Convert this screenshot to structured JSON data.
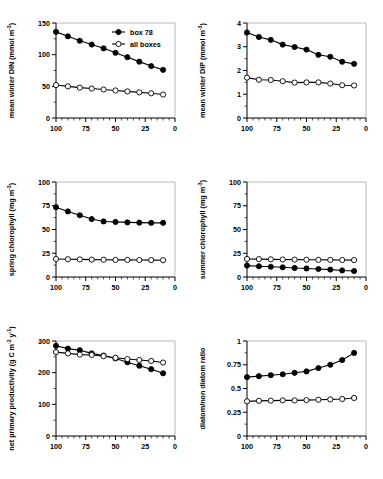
{
  "figure": {
    "panel_count": 6,
    "layout": "2 columns x 3 rows",
    "x_axis_shared": {
      "ticks": [
        "100",
        "75",
        "50",
        "25",
        "0"
      ],
      "range": [
        100,
        0
      ],
      "reversed": true
    },
    "legend": {
      "filled_label": "box 78",
      "open_label": "all boxes"
    },
    "colors": {
      "ink": "#000000",
      "frame": "#b9b9b9",
      "background": "#ffffff",
      "marker_open_fill": "#ffffff"
    }
  },
  "chart_data": [
    {
      "type": "line",
      "panel": "top-left",
      "title": "",
      "xlabel": "",
      "ylabel": "mean winter DIN (mmol m",
      "ylabel_sup": "-3",
      "ylabel_suffix": ")",
      "x": [
        100,
        90,
        80,
        70,
        60,
        50,
        40,
        30,
        20,
        10
      ],
      "xlim": [
        100,
        0
      ],
      "ylim": [
        0,
        150
      ],
      "yticks": [
        0,
        50,
        100,
        150
      ],
      "ytick_labels": [
        "0",
        "50",
        "100",
        "150"
      ],
      "grid": false,
      "legend_position": "top-right",
      "series": [
        {
          "name": "box 78",
          "marker": "filled",
          "values": [
            136,
            129,
            122,
            116,
            110,
            103,
            96,
            89,
            82,
            76
          ]
        },
        {
          "name": "all boxes",
          "marker": "open",
          "values": [
            52,
            50,
            48,
            46.5,
            45,
            43.5,
            42,
            40.5,
            39,
            37
          ]
        }
      ]
    },
    {
      "type": "line",
      "panel": "top-right",
      "title": "",
      "xlabel": "",
      "ylabel": "mean winter DIP (mmol m",
      "ylabel_sup": "-3",
      "ylabel_suffix": ")",
      "x": [
        100,
        90,
        80,
        70,
        60,
        50,
        40,
        30,
        20,
        10
      ],
      "xlim": [
        100,
        0
      ],
      "ylim": [
        0,
        4
      ],
      "yticks": [
        0,
        1,
        2,
        3,
        4
      ],
      "ytick_labels": [
        "0",
        "1",
        "2",
        "3",
        "4"
      ],
      "grid": false,
      "legend_position": "none",
      "series": [
        {
          "name": "box 78",
          "marker": "filled",
          "values": [
            3.6,
            3.41,
            3.29,
            3.09,
            2.99,
            2.88,
            2.66,
            2.58,
            2.37,
            2.28
          ]
        },
        {
          "name": "all boxes",
          "marker": "open",
          "values": [
            1.7,
            1.61,
            1.6,
            1.55,
            1.49,
            1.5,
            1.5,
            1.45,
            1.38,
            1.37
          ]
        }
      ]
    },
    {
      "type": "line",
      "panel": "middle-left",
      "title": "",
      "xlabel": "",
      "ylabel": "spring chlorophyll (mg m",
      "ylabel_sup": "-3",
      "ylabel_suffix": ")",
      "x": [
        100,
        90,
        80,
        70,
        60,
        50,
        40,
        30,
        20,
        10
      ],
      "xlim": [
        100,
        0
      ],
      "ylim": [
        0,
        100
      ],
      "yticks": [
        0,
        25,
        50,
        75,
        100
      ],
      "ytick_labels": [
        "0",
        "25",
        "50",
        "75",
        "100"
      ],
      "grid": false,
      "legend_position": "none",
      "series": [
        {
          "name": "box 78",
          "marker": "filled",
          "values": [
            73.5,
            69,
            65,
            61,
            58.5,
            58,
            57.5,
            57.2,
            57,
            57
          ]
        },
        {
          "name": "all boxes",
          "marker": "open",
          "values": [
            19,
            18.7,
            18.5,
            18.3,
            18.2,
            18,
            18,
            17.9,
            17.8,
            17.7
          ]
        }
      ]
    },
    {
      "type": "line",
      "panel": "middle-right",
      "title": "",
      "xlabel": "",
      "ylabel": "summer chlorophyll (mg m",
      "ylabel_sup": "-3",
      "ylabel_suffix": ")",
      "x": [
        100,
        90,
        80,
        70,
        60,
        50,
        40,
        30,
        20,
        10
      ],
      "xlim": [
        100,
        0
      ],
      "ylim": [
        0,
        100
      ],
      "yticks": [
        0,
        25,
        50,
        75,
        100
      ],
      "ytick_labels": [
        "0",
        "25",
        "50",
        "75",
        "100"
      ],
      "grid": false,
      "legend_position": "none",
      "series": [
        {
          "name": "box 78",
          "marker": "filled",
          "values": [
            12,
            11.3,
            10.8,
            10.2,
            9.5,
            9,
            8.4,
            7.8,
            6.9,
            6.3
          ]
        },
        {
          "name": "all boxes",
          "marker": "open",
          "values": [
            19,
            18.8,
            18.6,
            18.4,
            18.3,
            18.2,
            18.1,
            18,
            17.9,
            17.8
          ]
        }
      ]
    },
    {
      "type": "line",
      "panel": "bottom-left",
      "title": "",
      "xlabel": "",
      "ylabel": "net primary productivity (g C m",
      "ylabel_sup": "-2",
      "ylabel_sup2": "-1",
      "ylabel_mid": " y",
      "ylabel_suffix": ")",
      "x": [
        100,
        90,
        80,
        70,
        60,
        50,
        40,
        30,
        20,
        10
      ],
      "xlim": [
        100,
        0
      ],
      "ylim": [
        0,
        300
      ],
      "yticks": [
        0,
        100,
        200,
        300
      ],
      "ytick_labels": [
        "0",
        "100",
        "200",
        "300"
      ],
      "grid": false,
      "legend_position": "none",
      "series": [
        {
          "name": "box 78",
          "marker": "filled",
          "values": [
            285,
            276,
            271,
            261,
            254,
            245,
            233,
            222,
            211,
            198
          ]
        },
        {
          "name": "all boxes",
          "marker": "open",
          "values": [
            265,
            261,
            257,
            256,
            252,
            247,
            243,
            240,
            237,
            232
          ]
        }
      ]
    },
    {
      "type": "line",
      "panel": "bottom-right",
      "title": "",
      "xlabel": "",
      "ylabel": "diatom/non diatom ratio",
      "x": [
        100,
        90,
        80,
        70,
        60,
        50,
        40,
        30,
        20,
        10
      ],
      "xlim": [
        100,
        0
      ],
      "ylim": [
        0,
        1
      ],
      "yticks": [
        0,
        0.25,
        0.5,
        0.75,
        1
      ],
      "ytick_labels": [
        "0",
        "0.25",
        "0.5",
        "0.75",
        "1"
      ],
      "grid": false,
      "legend_position": "none",
      "series": [
        {
          "name": "box 78",
          "marker": "filled",
          "values": [
            0.62,
            0.63,
            0.64,
            0.65,
            0.665,
            0.68,
            0.715,
            0.75,
            0.8,
            0.875
          ]
        },
        {
          "name": "all boxes",
          "marker": "open",
          "values": [
            0.365,
            0.37,
            0.372,
            0.375,
            0.375,
            0.378,
            0.382,
            0.385,
            0.39,
            0.4
          ]
        }
      ]
    }
  ]
}
